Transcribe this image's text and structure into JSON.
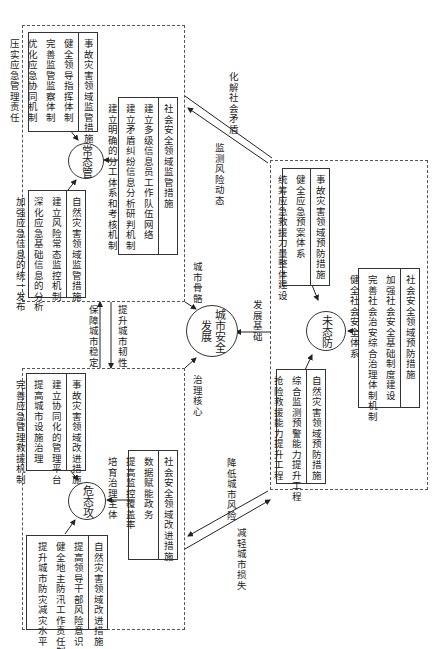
{
  "center": {
    "label_line1": "城市安全",
    "label_line2": "发展"
  },
  "states": {
    "normal": {
      "label": "常态管",
      "boxes": [
        {
          "title": "事故灾害领域监管措施",
          "items": [
            "健全领导指挥体制",
            "完善监管监察体制",
            "优化应急协同机制",
            "压实应急管理责任"
          ]
        },
        {
          "title": "自然灾害领域监管措施",
          "items": [
            "建立风险常态监控机制",
            "深化应急基础信息的分析",
            "加强应急信息的统一发布"
          ]
        },
        {
          "title": "社会安全领域监管措施",
          "items": [
            "建立多级信息员工作队伍网络",
            "建立矛盾纠纷信息分析研判机制",
            "建立明确的分工体系和考核机制"
          ]
        }
      ]
    },
    "prevention": {
      "label": "未态防",
      "boxes": [
        {
          "title": "事故灾害领域预防措施",
          "items": [
            "健全应急预案体系",
            "统筹应急救援力量整体建设"
          ]
        },
        {
          "title": "社会安全领域预防措施",
          "items": [
            "加强社会安全基础制度建设",
            "完善社会治安综合治理体制机制",
            "健全社会安全体系"
          ]
        },
        {
          "title": "自然灾害领域预防措施",
          "items": [
            "综合监测预警能力提升工程",
            "抢险救援能力提升工程"
          ]
        }
      ]
    },
    "crisis": {
      "label": "危态攻",
      "boxes": [
        {
          "title": "事故灾害领域改进措施",
          "items": [
            "建立协同化的管理平台",
            "提高城市设施治理",
            "完善应急管理救援机制"
          ]
        },
        {
          "title": "社会安全领域改进措施",
          "items": [
            "数据赋能政务",
            "提高监控覆盖率",
            "培育治理主体"
          ]
        },
        {
          "title": "自然灾害领域改进措施",
          "items": [
            "提高领导干部风险意识",
            "健全地主防汛工作责任制",
            "提升城市防灾减灾水平"
          ]
        }
      ]
    }
  },
  "edges": {
    "center_from_normal": "城市骨骼",
    "center_from_prevention": "发展基础",
    "center_from_crisis": "治理核心",
    "normal_to_prevention": "化解社会矛盾",
    "prevention_to_normal": "监测风险动态",
    "normal_crisis_up": "保障城市稳定",
    "normal_crisis_down": "提升城市韧性",
    "prevention_to_crisis": "降低城市风险",
    "crisis_to_prevention": "减轻城市损失"
  }
}
